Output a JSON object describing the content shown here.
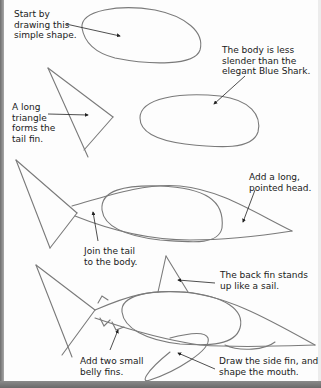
{
  "page": {
    "type": "drawing-tutorial",
    "subject": "shark",
    "colors": {
      "paper": "#fdfdfd",
      "pencil": "#777777",
      "text": "#1a1a1a",
      "edge": "#7a7a7a"
    }
  },
  "steps": [
    {
      "step": 1,
      "captions": [
        {
          "text": "Start by\ndrawing this\nsimple shape."
        }
      ]
    },
    {
      "step": 2,
      "captions": [
        {
          "text": "The body is less\nslender than the\nelegant Blue Shark."
        },
        {
          "text": "A long\ntriangle\nforms the\ntail fin."
        }
      ]
    },
    {
      "step": 3,
      "captions": [
        {
          "text": "Add a long,\npointed head."
        },
        {
          "text": "Join the tail\nto the body."
        }
      ]
    },
    {
      "step": 4,
      "captions": [
        {
          "text": "The back fin stands\nup like a sail."
        },
        {
          "text": "Add two small\nbelly fins."
        },
        {
          "text": "Draw the side fin, and\nshape the mouth."
        }
      ]
    }
  ]
}
